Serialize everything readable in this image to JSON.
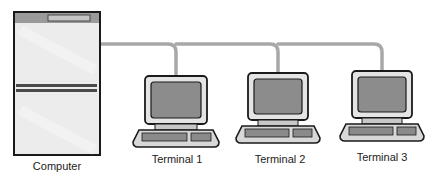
{
  "diagram": {
    "type": "network-topology",
    "colors": {
      "background": "#ffffff",
      "outline": "#1a1a1a",
      "cable": "#a8a8a8",
      "cabinet_fill": "#ececec",
      "cabinet_header": "#9a9a9a",
      "cabinet_bar": "#4a4a4a",
      "screen": "#8c8c8c",
      "bezel": "#e4e4e4",
      "keyboard": "#8a8a8a",
      "base": "#d8d8d8"
    },
    "nodes": [
      {
        "id": "computer",
        "kind": "computer",
        "label": "Computer"
      },
      {
        "id": "t1",
        "kind": "terminal",
        "label": "Terminal 1"
      },
      {
        "id": "t2",
        "kind": "terminal",
        "label": "Terminal 2"
      },
      {
        "id": "t3",
        "kind": "terminal",
        "label": "Terminal 3"
      }
    ],
    "edges": [
      {
        "from": "computer",
        "to": "t1"
      },
      {
        "from": "computer",
        "to": "t2"
      },
      {
        "from": "computer",
        "to": "t3"
      }
    ]
  }
}
